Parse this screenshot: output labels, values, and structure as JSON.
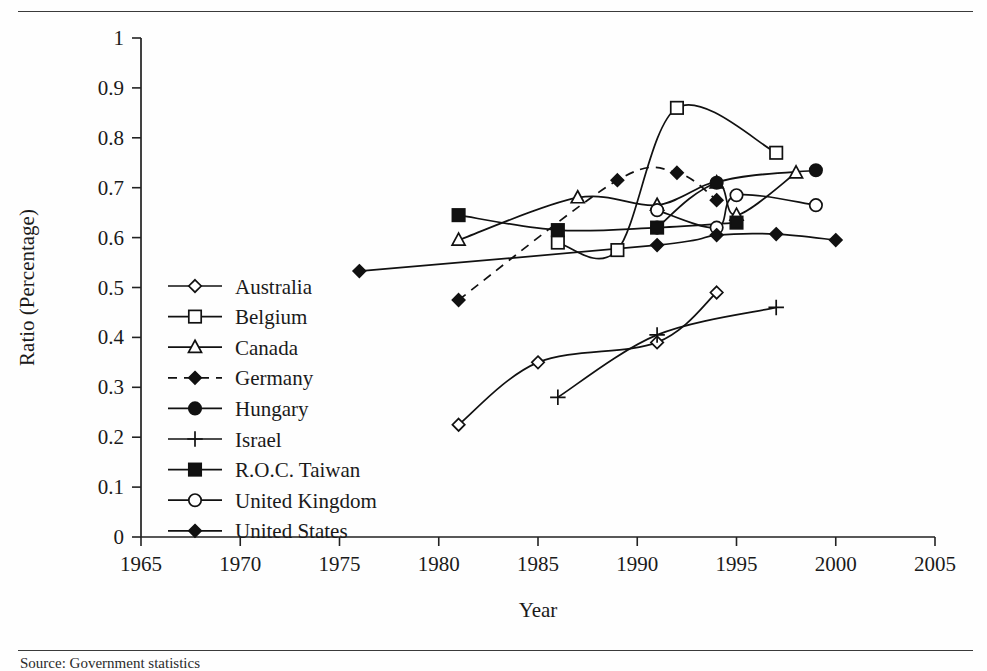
{
  "figure": {
    "source_note": "Source: Government statistics",
    "has_top_rule": true,
    "has_bottom_rule": true
  },
  "chart_data": {
    "type": "line",
    "title": "",
    "xlabel": "Year",
    "ylabel": "Ratio (Percentage)",
    "xlim": [
      1965,
      2005
    ],
    "ylim": [
      0,
      1
    ],
    "xticks": [
      1965,
      1970,
      1975,
      1980,
      1985,
      1990,
      1995,
      2000,
      2005
    ],
    "xtick_labels": [
      "1965",
      "1970",
      "1975",
      "1980",
      "1985",
      "1990",
      "1995",
      "2000",
      "2005"
    ],
    "yticks": [
      0,
      0.1,
      0.2,
      0.3,
      0.4,
      0.5,
      0.6,
      0.7,
      0.8,
      0.9,
      1
    ],
    "ytick_labels": [
      "0",
      "0.1",
      "0.2",
      "0.3",
      "0.4",
      "0.5",
      "0.6",
      "0.7",
      "0.8",
      "0.9",
      "1"
    ],
    "grid": false,
    "legend_position": "inside-left",
    "series": [
      {
        "name": "Australia",
        "marker": "open-diamond",
        "line_style": "solid",
        "x": [
          1981,
          1985,
          1991,
          1994
        ],
        "y": [
          0.225,
          0.35,
          0.39,
          0.49
        ]
      },
      {
        "name": "Belgium",
        "marker": "open-square",
        "line_style": "solid",
        "x": [
          1986,
          1989,
          1992,
          1997
        ],
        "y": [
          0.59,
          0.575,
          0.86,
          0.77
        ]
      },
      {
        "name": "Canada",
        "marker": "open-triangle",
        "line_style": "solid",
        "x": [
          1981,
          1987,
          1991,
          1994,
          1995,
          1998
        ],
        "y": [
          0.595,
          0.68,
          0.665,
          0.71,
          0.645,
          0.73
        ]
      },
      {
        "name": "Germany",
        "marker": "filled-diamond",
        "line_style": "dashed",
        "x": [
          1981,
          1989,
          1992,
          1994
        ],
        "y": [
          0.475,
          0.715,
          0.73,
          0.675
        ]
      },
      {
        "name": "Hungary",
        "marker": "filled-circle",
        "line_style": "solid",
        "x": [
          1991,
          1994,
          1999
        ],
        "y": [
          0.62,
          0.71,
          0.735
        ]
      },
      {
        "name": "Israel",
        "marker": "plus",
        "line_style": "solid",
        "x": [
          1986,
          1991,
          1997
        ],
        "y": [
          0.28,
          0.405,
          0.46
        ]
      },
      {
        "name": "R.O.C. Taiwan",
        "marker": "filled-square",
        "line_style": "solid",
        "x": [
          1981,
          1986,
          1991,
          1995
        ],
        "y": [
          0.645,
          0.615,
          0.62,
          0.63
        ]
      },
      {
        "name": "United Kingdom",
        "marker": "open-circle",
        "line_style": "solid",
        "x": [
          1991,
          1994,
          1995,
          1999
        ],
        "y": [
          0.655,
          0.62,
          0.685,
          0.665
        ]
      },
      {
        "name": "United States",
        "marker": "filled-diamond",
        "line_style": "solid",
        "x": [
          1976,
          1991,
          1994,
          1997,
          2000
        ],
        "y": [
          0.533,
          0.585,
          0.605,
          0.607,
          0.595
        ]
      }
    ]
  }
}
